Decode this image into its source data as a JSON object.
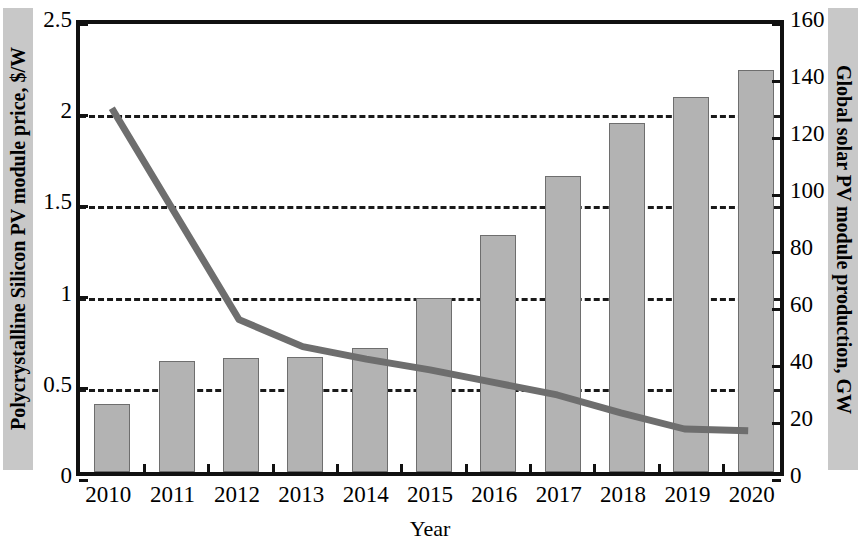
{
  "chart_data": {
    "type": "bar",
    "title": "",
    "xlabel": "Year",
    "categories": [
      "2010",
      "2011",
      "2012",
      "2013",
      "2014",
      "2015",
      "2016",
      "2017",
      "2018",
      "2019",
      "2020"
    ],
    "series": [
      {
        "name": "Global solar PV module production, GW",
        "type": "bar",
        "axis": "right",
        "color": "#b3b3b3",
        "edge_color": "#6e6e6e",
        "values": [
          24,
          39,
          40,
          40.5,
          43.5,
          61,
          83,
          104,
          122.5,
          131.5,
          141
        ]
      },
      {
        "name": "Polycrystalline Silicon PV module price, $/W",
        "type": "line",
        "axis": "left",
        "color": "#6e6e6e",
        "values": [
          2.03,
          1.44,
          0.85,
          0.7,
          0.63,
          0.57,
          0.5,
          0.43,
          0.33,
          0.24,
          0.23
        ]
      }
    ],
    "left_axis": {
      "label": "Polycrystalline Silicon PV module price, $/W",
      "ylim": [
        0,
        2.5
      ],
      "ticks": [
        0,
        0.5,
        1,
        1.5,
        2,
        2.5
      ],
      "tick_labels": [
        "0",
        "0.5",
        "1",
        "1.5",
        "2",
        "2.5"
      ]
    },
    "right_axis": {
      "label": "Global solar PV module production, GW",
      "ylim": [
        0,
        160
      ],
      "ticks": [
        0,
        20,
        40,
        60,
        80,
        100,
        120,
        140,
        160
      ],
      "tick_labels": [
        "0",
        "20",
        "40",
        "60",
        "80",
        "100",
        "120",
        "140",
        "160"
      ]
    },
    "grid": {
      "enabled": true,
      "style": "dashed",
      "values_left": [
        0.5,
        1,
        1.5,
        2
      ]
    },
    "legend": {
      "present": false,
      "position": "none"
    }
  },
  "axes": {
    "left_title": "Polycrystalline Silicon PV module price, $/W",
    "right_title": "Global solar PV module production, GW",
    "x_title": "Year"
  }
}
